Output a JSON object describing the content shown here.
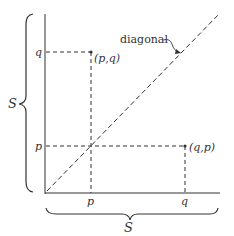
{
  "diagram": {
    "type": "cartesian-product-square",
    "colors": {
      "ink": "#333333",
      "background": "#ffffff"
    },
    "axes": {
      "x_set_label": "S",
      "y_set_label": "S",
      "x_ticks": [
        {
          "label": "p"
        },
        {
          "label": "q"
        }
      ],
      "y_ticks": [
        {
          "label": "q"
        },
        {
          "label": "p"
        }
      ]
    },
    "points": [
      {
        "label": "(p,q)"
      },
      {
        "label": "(q,p)"
      }
    ],
    "diagonal": {
      "label": "diagonal"
    }
  }
}
